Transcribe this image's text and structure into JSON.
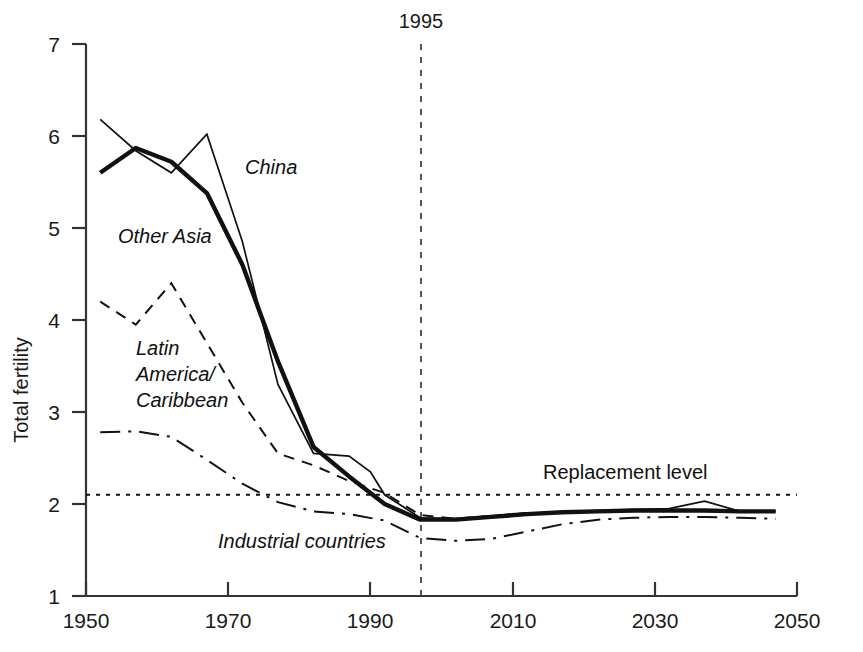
{
  "chart_data": {
    "type": "line",
    "title": "",
    "xlabel": "",
    "ylabel": "Total fertility",
    "xlim": [
      1950,
      2050
    ],
    "ylim": [
      1,
      7
    ],
    "xticks": [
      1950,
      1970,
      1990,
      2010,
      2030,
      2050
    ],
    "yticks": [
      1,
      2,
      3,
      4,
      5,
      6,
      7
    ],
    "grid": false,
    "legend_position": "inline-labels",
    "annotations": [
      {
        "name": "year-marker",
        "text": "1995",
        "x": 1995,
        "style": "vertical-dashed-line"
      },
      {
        "name": "replacement-level",
        "text": "Replacement level",
        "y": 2.1,
        "style": "horizontal-dotted-line"
      }
    ],
    "series": [
      {
        "name": "China",
        "label": "China",
        "style": "thin-solid",
        "x": [
          1952,
          1957,
          1962,
          1967,
          1972,
          1977,
          1982,
          1987,
          1990,
          1992,
          1997,
          2002,
          2007,
          2012,
          2017,
          2022,
          2027,
          2032,
          2037,
          2042,
          2047
        ],
        "values": [
          6.18,
          5.84,
          5.6,
          6.02,
          4.85,
          3.3,
          2.55,
          2.52,
          2.35,
          2.1,
          1.85,
          1.84,
          1.87,
          1.9,
          1.91,
          1.93,
          1.94,
          1.95,
          2.03,
          1.92,
          1.92
        ]
      },
      {
        "name": "Other Asia",
        "label": "Other Asia",
        "style": "thick-solid",
        "x": [
          1952,
          1957,
          1962,
          1967,
          1972,
          1977,
          1982,
          1987,
          1992,
          1997,
          2002,
          2007,
          2012,
          2017,
          2022,
          2027,
          2032,
          2037,
          2042,
          2047
        ],
        "values": [
          5.6,
          5.87,
          5.72,
          5.38,
          4.6,
          3.55,
          2.62,
          2.3,
          2.0,
          1.83,
          1.83,
          1.86,
          1.89,
          1.91,
          1.92,
          1.93,
          1.93,
          1.93,
          1.92,
          1.92
        ]
      },
      {
        "name": "Latin America/Caribbean",
        "label": "Latin America/ Caribbean",
        "style": "dashed",
        "x": [
          1952,
          1957,
          1962,
          1967,
          1972,
          1977,
          1982,
          1987,
          1992,
          1997,
          2002,
          2007,
          2012,
          2017,
          2022,
          2027,
          2032,
          2037,
          2042,
          2047
        ],
        "values": [
          4.2,
          3.95,
          4.4,
          3.75,
          3.1,
          2.55,
          2.42,
          2.25,
          2.12,
          1.88,
          1.84,
          1.87,
          1.9,
          1.91,
          1.92,
          1.93,
          1.93,
          1.93,
          1.92,
          1.92
        ]
      },
      {
        "name": "Industrial countries",
        "label": "Industrial countries",
        "style": "dash-dot",
        "x": [
          1952,
          1957,
          1962,
          1967,
          1972,
          1977,
          1982,
          1987,
          1992,
          1997,
          2002,
          2007,
          2012,
          2017,
          2022,
          2027,
          2032,
          2037,
          2042,
          2047
        ],
        "values": [
          2.78,
          2.79,
          2.73,
          2.48,
          2.22,
          2.02,
          1.92,
          1.89,
          1.82,
          1.63,
          1.6,
          1.62,
          1.7,
          1.78,
          1.83,
          1.85,
          1.86,
          1.86,
          1.85,
          1.84
        ]
      },
      {
        "name": "Replacement level",
        "label": "Replacement level",
        "style": "dotted",
        "x": [
          1950,
          2050
        ],
        "values": [
          2.1,
          2.1
        ]
      }
    ]
  },
  "axis": {
    "y_title": "Total fertility",
    "y_tick_labels": [
      "7",
      "6",
      "5",
      "4",
      "3",
      "2",
      "1"
    ],
    "x_tick_labels": [
      "1950",
      "1970",
      "1990",
      "2010",
      "2030",
      "2050"
    ]
  },
  "labels": {
    "china": "China",
    "other_asia": "Other Asia",
    "latin_line1": "Latin",
    "latin_line2": "America/",
    "latin_line3": "Caribbean",
    "industrial": "Industrial countries",
    "replacement": "Replacement level",
    "year_marker": "1995"
  },
  "colors": {
    "line": "#111111",
    "axis": "#333333",
    "background": "#ffffff"
  }
}
